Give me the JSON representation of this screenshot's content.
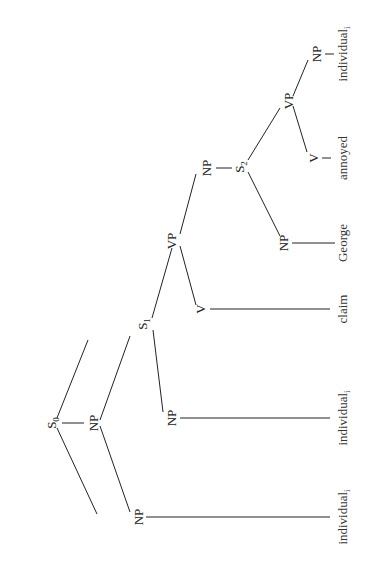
{
  "diagram": {
    "type": "syntax-tree",
    "orientation": "rotated-90-ccw",
    "nodes": {
      "s0": {
        "label": "S",
        "sub": "0"
      },
      "np_top": {
        "label": "NP"
      },
      "np_left": {
        "label": "NP"
      },
      "s1": {
        "label": "S",
        "sub": "1"
      },
      "np_s1": {
        "label": "NP"
      },
      "vp1": {
        "label": "VP"
      },
      "v1": {
        "label": "V"
      },
      "np_vp1": {
        "label": "NP"
      },
      "s2": {
        "label": "S",
        "sub": "2"
      },
      "np_s2": {
        "label": "NP"
      },
      "vp2": {
        "label": "VP"
      },
      "v2": {
        "label": "V"
      },
      "np_vp2": {
        "label": "NP"
      }
    },
    "leaves": {
      "leaf1": {
        "word": "individual",
        "sub": "i"
      },
      "leaf2": {
        "word": "individual",
        "sub": "i"
      },
      "leaf3": {
        "word": "claim"
      },
      "leaf4": {
        "word": "George"
      },
      "leaf5": {
        "word": "annoyed"
      },
      "leaf6": {
        "word": "individual",
        "sub": "i"
      }
    }
  }
}
